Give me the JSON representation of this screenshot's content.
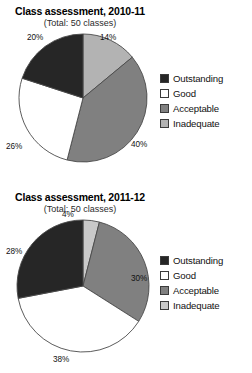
{
  "chart_data": [
    {
      "type": "pie",
      "title": "Class assessment, 2010-11",
      "subtitle": "(Total: 50 classes)",
      "total_label": "Total: 50 classes",
      "total": 50,
      "unit": "%",
      "start_angle_deg": 0,
      "direction": "clockwise",
      "categories": [
        "Inadequate",
        "Acceptable",
        "Good",
        "Outstanding"
      ],
      "values": [
        14,
        40,
        26,
        20
      ],
      "slices": [
        {
          "label": "Inadequate",
          "value": 14,
          "value_label": "14%",
          "color": "#b3b3b3"
        },
        {
          "label": "Acceptable",
          "value": 40,
          "value_label": "40%",
          "color": "#808080"
        },
        {
          "label": "Good",
          "value": 26,
          "value_label": "26%",
          "color": "#ffffff"
        },
        {
          "label": "Outstanding",
          "value": 20,
          "value_label": "20%",
          "color": "#262626"
        }
      ],
      "legend": {
        "position": "right",
        "entries": [
          {
            "label": "Outstanding",
            "color": "#262626"
          },
          {
            "label": "Good",
            "color": "#ffffff"
          },
          {
            "label": "Acceptable",
            "color": "#808080"
          },
          {
            "label": "Inadequate",
            "color": "#b3b3b3"
          }
        ]
      }
    },
    {
      "type": "pie",
      "title": "Class assessment, 2011-12",
      "subtitle": "(Total: 50 classes)",
      "total_label": "Total: 50 classes",
      "total": 50,
      "unit": "%",
      "start_angle_deg": 0,
      "direction": "clockwise",
      "categories": [
        "Inadequate",
        "Acceptable",
        "Good",
        "Outstanding"
      ],
      "values": [
        4,
        30,
        38,
        28
      ],
      "slices": [
        {
          "label": "Inadequate",
          "value": 4,
          "value_label": "4%",
          "color": "#c9c9c9"
        },
        {
          "label": "Acceptable",
          "value": 30,
          "value_label": "30%",
          "color": "#808080"
        },
        {
          "label": "Good",
          "value": 38,
          "value_label": "38%",
          "color": "#ffffff"
        },
        {
          "label": "Outstanding",
          "value": 28,
          "value_label": "28%",
          "color": "#262626"
        }
      ],
      "legend": {
        "position": "right",
        "entries": [
          {
            "label": "Outstanding",
            "color": "#262626"
          },
          {
            "label": "Good",
            "color": "#ffffff"
          },
          {
            "label": "Acceptable",
            "color": "#808080"
          },
          {
            "label": "Inadequate",
            "color": "#c9c9c9"
          }
        ]
      }
    }
  ],
  "colors": {
    "outstanding": "#262626",
    "good": "#ffffff",
    "acceptable": "#808080",
    "inadequate": "#b3b3b3",
    "outline": "#3b3b3b",
    "text": "#111111",
    "background": "#ffffff"
  }
}
